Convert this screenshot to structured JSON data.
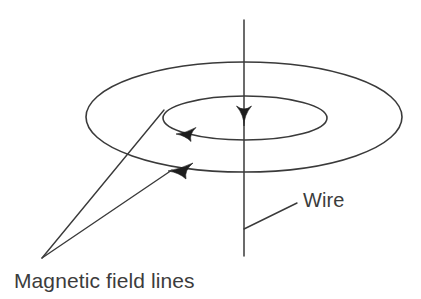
{
  "figure": {
    "background_color": "#ffffff",
    "line_color": "#3a3a3a",
    "arrow_color": "#1d1d1d",
    "text_color": "#3c3c3c",
    "width": 421,
    "height": 299
  },
  "labels": {
    "wire": "Wire",
    "field_lines": "Magnetic field lines"
  },
  "diagram": {
    "wire": {
      "name": "current-carrying-wire",
      "orientation": "vertical",
      "x": 244,
      "y_top": 20,
      "y_bottom": 256,
      "current_direction": "downward"
    },
    "current_arrow": {
      "name": "current-direction-arrow",
      "tip_x": 244,
      "tip_y": 126,
      "direction": "down"
    },
    "field_loops": [
      {
        "name": "inner-field-loop",
        "cx": 245,
        "cy": 118,
        "rx": 82,
        "ry": 22,
        "arrow_direction": "counterclockwise-left"
      },
      {
        "name": "outer-field-loop",
        "cx": 244,
        "cy": 117,
        "rx": 158,
        "ry": 55,
        "arrow_direction": "counterclockwise-left"
      }
    ],
    "loop_arrows": [
      {
        "name": "inner-loop-arrow",
        "tip_x": 176,
        "tip_y": 134,
        "direction": "left"
      },
      {
        "name": "outer-loop-arrow",
        "tip_x": 168,
        "tip_y": 171,
        "direction": "left"
      }
    ],
    "leaders": [
      {
        "name": "field-lines-leader-inner",
        "from_x": 42,
        "from_y": 258,
        "to_x": 164,
        "to_y": 110
      },
      {
        "name": "field-lines-leader-outer",
        "from_x": 42,
        "from_y": 258,
        "to_x": 172,
        "to_y": 170
      },
      {
        "name": "wire-leader",
        "from_x": 297,
        "from_y": 203,
        "to_x": 244,
        "to_y": 229
      }
    ]
  },
  "text_positions": {
    "wire": {
      "x": 303,
      "y": 207
    },
    "field_lines": {
      "x": 14,
      "y": 288
    }
  }
}
